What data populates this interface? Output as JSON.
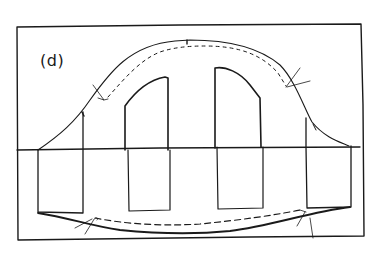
{
  "diagram": {
    "panel_label": "(d)",
    "colors": {
      "ink": "#1a1a1a",
      "background": "#ffffff"
    },
    "elements": {
      "frame": "rectangular border",
      "axis": "horizontal baseline through middle",
      "pulses": [
        "pulse-1",
        "pulse-2",
        "pulse-3",
        "pulse-4"
      ],
      "envelope_upper_solid": "bell curve",
      "envelope_upper_dashed": "inner bell curve",
      "envelope_lower_solid": "shallow curve",
      "envelope_lower_dashed": "inner shallow curve",
      "annotation_arrows": 5
    }
  }
}
